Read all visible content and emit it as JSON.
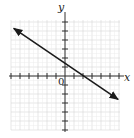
{
  "chart_data": {
    "type": "line",
    "title": "",
    "xlabel": "x",
    "ylabel": "y",
    "origin_label": "0",
    "grid": true,
    "xlim": [
      -6,
      6
    ],
    "ylim": [
      -6,
      6
    ],
    "series": [
      {
        "name": "line",
        "equation": "y = -2/3 x + 4/3",
        "points": [
          [
            -5.7,
            5.3
          ],
          [
            0,
            1.33
          ],
          [
            2,
            0
          ],
          [
            5.9,
            -2.6
          ]
        ],
        "arrows": "both"
      }
    ],
    "colors": {
      "line": "#1a1a1a",
      "grid": "#d6d6d6",
      "axes": "#333333"
    }
  }
}
